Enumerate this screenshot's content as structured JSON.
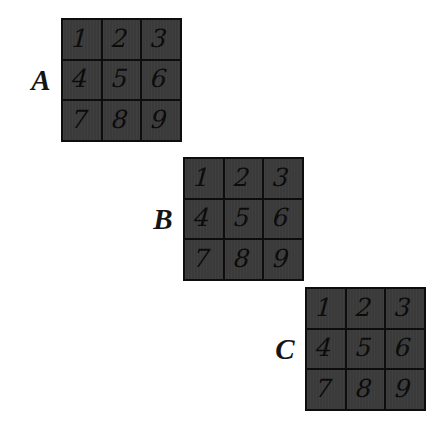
{
  "figure": {
    "background_color": "#ffffff",
    "grid_fill_color": "#3b3b3b",
    "grid_line_color": "#0d0d0d",
    "text_color": "#0a0a0a",
    "label_color": "#141414"
  },
  "grids": [
    {
      "label": "A",
      "rows": [
        [
          "1",
          "2",
          "3"
        ],
        [
          "4",
          "5",
          "6"
        ],
        [
          "7",
          "8",
          "9"
        ]
      ]
    },
    {
      "label": "B",
      "rows": [
        [
          "1",
          "2",
          "3"
        ],
        [
          "4",
          "5",
          "6"
        ],
        [
          "7",
          "8",
          "9"
        ]
      ]
    },
    {
      "label": "C",
      "rows": [
        [
          "1",
          "2",
          "3"
        ],
        [
          "4",
          "5",
          "6"
        ],
        [
          "7",
          "8",
          "9"
        ]
      ]
    }
  ]
}
